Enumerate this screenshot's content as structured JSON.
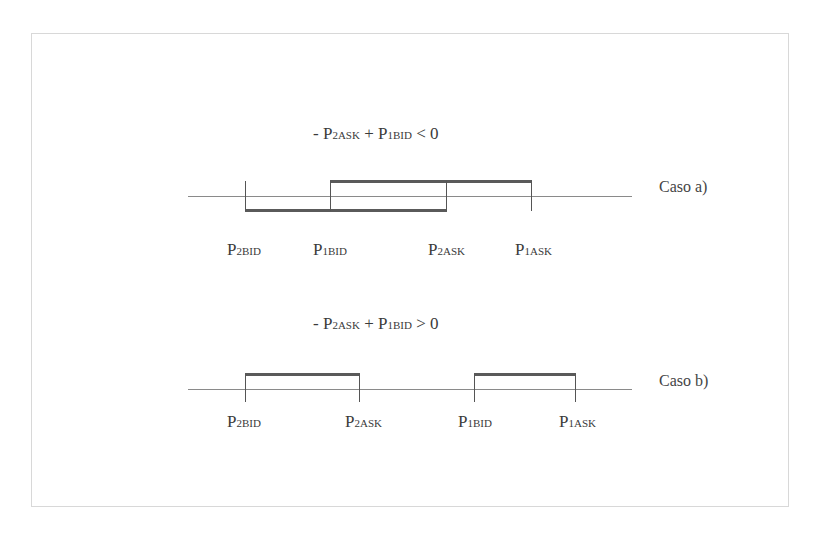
{
  "diagram": {
    "case_a": {
      "equation": {
        "prefix": "- P",
        "sub1": "2ASK",
        "op": " + P",
        "sub2": "1BID",
        "relation": " < 0"
      },
      "label": "Caso a)",
      "points": [
        {
          "p": "P",
          "sub": "2BID"
        },
        {
          "p": "P",
          "sub": "1BID"
        },
        {
          "p": "P",
          "sub": "2ASK"
        },
        {
          "p": "P",
          "sub": "1ASK"
        }
      ]
    },
    "case_b": {
      "equation": {
        "prefix": "- P",
        "sub1": "2ASK",
        "op": " + P",
        "sub2": "1BID",
        "relation": " > 0"
      },
      "label": "Caso b)",
      "points": [
        {
          "p": "P",
          "sub": "2BID"
        },
        {
          "p": "P",
          "sub": "2ASK"
        },
        {
          "p": "P",
          "sub": "1BID"
        },
        {
          "p": "P",
          "sub": "1ASK"
        }
      ]
    }
  }
}
